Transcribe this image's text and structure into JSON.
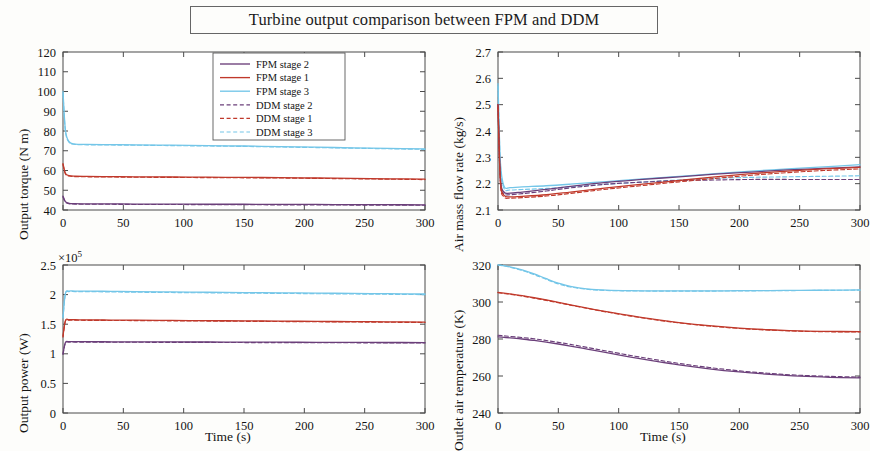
{
  "figure": {
    "title": "Turbine output comparison between FPM and DDM",
    "xlabel": "Time (s)"
  },
  "legend": {
    "position": "top-right of subplot 1",
    "entries": [
      {
        "label": "FPM stage 2",
        "color": "#6b3f7a",
        "style": "solid"
      },
      {
        "label": "FPM stage 1",
        "color": "#c0392b",
        "style": "solid"
      },
      {
        "label": "FPM stage 3",
        "color": "#74c6e8",
        "style": "solid"
      },
      {
        "label": "DDM stage 2",
        "color": "#6b3f7a",
        "style": "dashed"
      },
      {
        "label": "DDM stage 1",
        "color": "#c0392b",
        "style": "dashed"
      },
      {
        "label": "DDM stage 3",
        "color": "#74c6e8",
        "style": "dashed"
      }
    ]
  },
  "colors": {
    "stage1": "#c0392b",
    "stage2": "#6b3f7a",
    "stage3": "#74c6e8",
    "frame": "#4b4b4b",
    "background": "#fdfdfb"
  },
  "chart_data": [
    {
      "type": "line",
      "id": "output-torque",
      "title": "",
      "xlabel": "",
      "ylabel": "Output torque (N m)",
      "xlim": [
        0,
        300
      ],
      "ylim": [
        40,
        120
      ],
      "xticks": [
        0,
        50,
        100,
        150,
        200,
        250,
        300
      ],
      "yticks": [
        40,
        50,
        60,
        70,
        80,
        90,
        100,
        110,
        120
      ],
      "grid": false,
      "x": [
        0,
        2,
        5,
        10,
        20,
        40,
        60,
        90,
        120,
        150,
        180,
        210,
        240,
        270,
        300
      ],
      "series": [
        {
          "name": "FPM stage 3",
          "color": "#74c6e8",
          "style": "solid",
          "values": [
            100.0,
            80.5,
            74.6,
            73.4,
            73.2,
            73.1,
            73.0,
            72.8,
            72.6,
            72.4,
            72.1,
            71.8,
            71.5,
            71.2,
            70.9
          ]
        },
        {
          "name": "DDM stage 3",
          "color": "#74c6e8",
          "style": "dashed",
          "values": [
            99.0,
            80.0,
            74.3,
            73.2,
            73.0,
            72.9,
            72.8,
            72.6,
            72.4,
            72.2,
            71.9,
            71.6,
            71.3,
            71.0,
            70.7
          ]
        },
        {
          "name": "FPM stage 1",
          "color": "#c0392b",
          "style": "solid",
          "values": [
            63.5,
            58.6,
            57.4,
            57.1,
            57.0,
            56.9,
            56.8,
            56.7,
            56.6,
            56.5,
            56.4,
            56.2,
            56.0,
            55.8,
            55.6
          ]
        },
        {
          "name": "DDM stage 1",
          "color": "#c0392b",
          "style": "dashed",
          "values": [
            63.0,
            58.3,
            57.2,
            56.9,
            56.8,
            56.7,
            56.6,
            56.5,
            56.4,
            56.3,
            56.2,
            56.0,
            55.8,
            55.6,
            55.4
          ]
        },
        {
          "name": "FPM stage 2",
          "color": "#6b3f7a",
          "style": "solid",
          "values": [
            47.0,
            44.2,
            43.4,
            43.2,
            43.1,
            43.1,
            43.0,
            43.0,
            42.9,
            42.9,
            42.8,
            42.8,
            42.7,
            42.7,
            42.6
          ]
        },
        {
          "name": "DDM stage 2",
          "color": "#6b3f7a",
          "style": "dashed",
          "values": [
            46.6,
            44.0,
            43.2,
            43.0,
            42.9,
            42.9,
            42.8,
            42.8,
            42.7,
            42.7,
            42.6,
            42.6,
            42.5,
            42.5,
            42.4
          ]
        }
      ]
    },
    {
      "type": "line",
      "id": "air-mass-flow-rate",
      "title": "",
      "xlabel": "",
      "ylabel": "Air mass flow rate (kg/s)",
      "xlim": [
        0,
        300
      ],
      "ylim": [
        2.1,
        2.7
      ],
      "xticks": [
        0,
        50,
        100,
        150,
        200,
        250,
        300
      ],
      "yticks": [
        2.1,
        2.2,
        2.3,
        2.4,
        2.5,
        2.6,
        2.7
      ],
      "grid": false,
      "x": [
        0,
        2,
        5,
        10,
        20,
        40,
        60,
        90,
        120,
        150,
        180,
        210,
        240,
        270,
        300
      ],
      "series": [
        {
          "name": "FPM stage 3",
          "color": "#74c6e8",
          "style": "solid",
          "values": [
            2.58,
            2.28,
            2.19,
            2.185,
            2.188,
            2.192,
            2.198,
            2.208,
            2.218,
            2.228,
            2.238,
            2.248,
            2.256,
            2.264,
            2.272
          ]
        },
        {
          "name": "DDM stage 3",
          "color": "#74c6e8",
          "style": "dashed",
          "values": [
            2.57,
            2.27,
            2.182,
            2.176,
            2.178,
            2.182,
            2.188,
            2.198,
            2.206,
            2.214,
            2.22,
            2.224,
            2.226,
            2.228,
            2.23
          ]
        },
        {
          "name": "FPM stage 2",
          "color": "#6b3f7a",
          "style": "solid",
          "values": [
            2.5,
            2.22,
            2.168,
            2.164,
            2.168,
            2.178,
            2.19,
            2.205,
            2.216,
            2.226,
            2.236,
            2.244,
            2.252,
            2.258,
            2.264
          ]
        },
        {
          "name": "DDM stage 2",
          "color": "#6b3f7a",
          "style": "dashed",
          "values": [
            2.5,
            2.21,
            2.162,
            2.158,
            2.162,
            2.172,
            2.184,
            2.198,
            2.206,
            2.212,
            2.214,
            2.216,
            2.216,
            2.216,
            2.216
          ]
        },
        {
          "name": "FPM stage 1",
          "color": "#c0392b",
          "style": "solid",
          "values": [
            2.5,
            2.21,
            2.156,
            2.15,
            2.152,
            2.158,
            2.168,
            2.184,
            2.198,
            2.212,
            2.226,
            2.238,
            2.248,
            2.256,
            2.262
          ]
        },
        {
          "name": "DDM stage 1",
          "color": "#c0392b",
          "style": "dashed",
          "values": [
            2.49,
            2.2,
            2.15,
            2.145,
            2.147,
            2.153,
            2.163,
            2.179,
            2.193,
            2.207,
            2.22,
            2.232,
            2.242,
            2.25,
            2.256
          ]
        }
      ]
    },
    {
      "type": "line",
      "id": "output-power",
      "title": "",
      "xlabel": "Time (s)",
      "ylabel": "Output power (W)",
      "y_multiplier": "×10",
      "y_multiplier_exp": "5",
      "xlim": [
        0,
        300
      ],
      "ylim": [
        0,
        2.5
      ],
      "xticks": [
        0,
        50,
        100,
        150,
        200,
        250,
        300
      ],
      "yticks": [
        0,
        0.5,
        1,
        1.5,
        2,
        2.5
      ],
      "grid": false,
      "x": [
        0,
        2,
        5,
        10,
        20,
        40,
        60,
        90,
        120,
        150,
        180,
        210,
        240,
        270,
        300
      ],
      "series": [
        {
          "name": "FPM stage 3",
          "color": "#74c6e8",
          "style": "solid",
          "values": [
            1.62,
            2.02,
            2.06,
            2.06,
            2.06,
            2.055,
            2.05,
            2.045,
            2.04,
            2.035,
            2.03,
            2.025,
            2.02,
            2.015,
            2.01
          ]
        },
        {
          "name": "DDM stage 3",
          "color": "#74c6e8",
          "style": "dashed",
          "values": [
            1.6,
            2.01,
            2.05,
            2.05,
            2.05,
            2.045,
            2.04,
            2.035,
            2.03,
            2.025,
            2.02,
            2.015,
            2.01,
            2.005,
            2.0
          ]
        },
        {
          "name": "FPM stage 1",
          "color": "#c0392b",
          "style": "solid",
          "values": [
            1.3,
            1.56,
            1.575,
            1.575,
            1.572,
            1.57,
            1.568,
            1.564,
            1.56,
            1.556,
            1.552,
            1.548,
            1.544,
            1.54,
            1.536
          ]
        },
        {
          "name": "DDM stage 1",
          "color": "#c0392b",
          "style": "dashed",
          "values": [
            1.28,
            1.55,
            1.568,
            1.568,
            1.565,
            1.563,
            1.561,
            1.557,
            1.553,
            1.549,
            1.545,
            1.541,
            1.537,
            1.533,
            1.529
          ]
        },
        {
          "name": "FPM stage 2",
          "color": "#6b3f7a",
          "style": "solid",
          "values": [
            1.0,
            1.19,
            1.205,
            1.205,
            1.204,
            1.203,
            1.202,
            1.2,
            1.199,
            1.197,
            1.196,
            1.194,
            1.193,
            1.191,
            1.19
          ]
        },
        {
          "name": "DDM stage 2",
          "color": "#6b3f7a",
          "style": "dashed",
          "values": [
            0.99,
            1.18,
            1.198,
            1.198,
            1.197,
            1.196,
            1.195,
            1.193,
            1.192,
            1.19,
            1.189,
            1.187,
            1.186,
            1.184,
            1.183
          ]
        }
      ]
    },
    {
      "type": "line",
      "id": "outlet-air-temperature",
      "title": "",
      "xlabel": "Time (s)",
      "ylabel": "Outlet air temperature (K)",
      "xlim": [
        0,
        300
      ],
      "ylim": [
        240,
        320
      ],
      "xticks": [
        0,
        50,
        100,
        150,
        200,
        250,
        300
      ],
      "yticks": [
        240,
        260,
        280,
        300,
        320
      ],
      "grid": false,
      "x": [
        0,
        5,
        10,
        20,
        30,
        40,
        50,
        60,
        75,
        90,
        110,
        130,
        150,
        175,
        200,
        225,
        250,
        275,
        300
      ],
      "series": [
        {
          "name": "FPM stage 3",
          "color": "#74c6e8",
          "style": "solid",
          "values": [
            320.0,
            319.6,
            319.0,
            317.4,
            315.2,
            312.6,
            310.2,
            308.4,
            307.0,
            306.4,
            306.1,
            306.0,
            306.0,
            306.0,
            306.1,
            306.2,
            306.3,
            306.4,
            306.5
          ]
        },
        {
          "name": "DDM stage 3",
          "color": "#74c6e8",
          "style": "dashed",
          "values": [
            320.0,
            319.5,
            318.8,
            317.0,
            314.8,
            312.2,
            309.8,
            308.1,
            306.8,
            306.2,
            306.0,
            305.9,
            305.9,
            305.9,
            306.0,
            306.1,
            306.2,
            306.3,
            306.4
          ]
        },
        {
          "name": "FPM stage 1",
          "color": "#c0392b",
          "style": "solid",
          "values": [
            305.2,
            304.8,
            304.4,
            303.4,
            302.3,
            301.1,
            299.8,
            298.5,
            296.6,
            294.8,
            292.6,
            290.6,
            288.9,
            287.2,
            285.9,
            285.0,
            284.4,
            284.1,
            284.0
          ]
        },
        {
          "name": "DDM stage 1",
          "color": "#c0392b",
          "style": "dashed",
          "values": [
            305.0,
            304.6,
            304.2,
            303.2,
            302.1,
            300.9,
            299.6,
            298.3,
            296.4,
            294.6,
            292.4,
            290.4,
            288.7,
            287.0,
            285.7,
            284.8,
            284.2,
            283.9,
            283.8
          ]
        },
        {
          "name": "FPM stage 2",
          "color": "#6b3f7a",
          "style": "solid",
          "values": [
            281.2,
            280.9,
            280.6,
            280.0,
            279.2,
            278.3,
            277.3,
            276.2,
            274.4,
            272.6,
            270.2,
            268.0,
            266.0,
            263.9,
            262.2,
            260.9,
            259.9,
            259.3,
            259.0
          ]
        },
        {
          "name": "DDM stage 2",
          "color": "#6b3f7a",
          "style": "dashed",
          "values": [
            282.0,
            281.7,
            281.4,
            280.8,
            280.1,
            279.2,
            278.2,
            277.1,
            275.3,
            273.5,
            271.1,
            268.9,
            266.8,
            264.6,
            262.8,
            261.4,
            260.4,
            259.8,
            259.4
          ]
        }
      ]
    }
  ]
}
